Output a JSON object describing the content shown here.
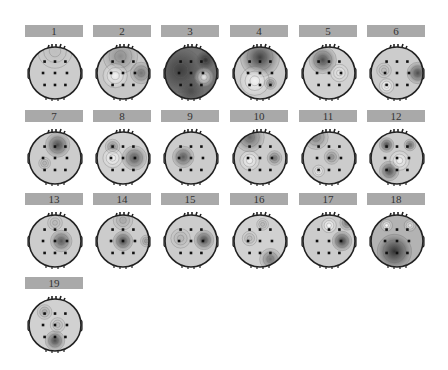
{
  "figure": {
    "type": "eeg-topographic-maps-grid",
    "colormap": "grayscale",
    "columns": 6,
    "electrodes_per_map": 9,
    "maps": [
      {
        "label": "1",
        "blobs": [
          {
            "x": 0.5,
            "y": 0.08,
            "r": 0.35,
            "v": 0.75
          }
        ],
        "base": 0.8
      },
      {
        "label": "2",
        "blobs": [
          {
            "x": 0.45,
            "y": 0.18,
            "r": 0.35,
            "v": 0.55
          },
          {
            "x": 0.85,
            "y": 0.5,
            "r": 0.22,
            "v": 0.45
          },
          {
            "x": 0.35,
            "y": 0.55,
            "r": 0.25,
            "v": 0.95
          }
        ],
        "base": 0.78
      },
      {
        "label": "3",
        "blobs": [
          {
            "x": 0.3,
            "y": 0.45,
            "r": 0.45,
            "v": 0.25
          },
          {
            "x": 0.78,
            "y": 0.25,
            "r": 0.18,
            "v": 0.2
          },
          {
            "x": 0.75,
            "y": 0.58,
            "r": 0.2,
            "v": 0.9
          },
          {
            "x": 0.5,
            "y": 0.85,
            "r": 0.25,
            "v": 0.3
          }
        ],
        "base": 0.45
      },
      {
        "label": "4",
        "blobs": [
          {
            "x": 0.5,
            "y": 0.2,
            "r": 0.4,
            "v": 0.25
          },
          {
            "x": 0.4,
            "y": 0.65,
            "r": 0.3,
            "v": 0.95
          },
          {
            "x": 0.7,
            "y": 0.7,
            "r": 0.12,
            "v": 0.55
          }
        ],
        "base": 0.8
      },
      {
        "label": "5",
        "blobs": [
          {
            "x": 0.38,
            "y": 0.25,
            "r": 0.28,
            "v": 0.3
          },
          {
            "x": 0.7,
            "y": 0.5,
            "r": 0.18,
            "v": 0.9
          }
        ],
        "base": 0.82
      },
      {
        "label": "6",
        "blobs": [
          {
            "x": 0.9,
            "y": 0.5,
            "r": 0.22,
            "v": 0.3
          },
          {
            "x": 0.3,
            "y": 0.75,
            "r": 0.15,
            "v": 0.98
          },
          {
            "x": 0.25,
            "y": 0.45,
            "r": 0.15,
            "v": 0.72
          }
        ],
        "base": 0.8
      },
      {
        "label": "7",
        "blobs": [
          {
            "x": 0.55,
            "y": 0.25,
            "r": 0.25,
            "v": 0.3
          },
          {
            "x": 0.3,
            "y": 0.6,
            "r": 0.12,
            "v": 0.7
          }
        ],
        "base": 0.8
      },
      {
        "label": "8",
        "blobs": [
          {
            "x": 0.72,
            "y": 0.5,
            "r": 0.25,
            "v": 0.35
          },
          {
            "x": 0.3,
            "y": 0.28,
            "r": 0.15,
            "v": 0.55
          },
          {
            "x": 0.3,
            "y": 0.5,
            "r": 0.2,
            "v": 0.95
          }
        ],
        "base": 0.82
      },
      {
        "label": "9",
        "blobs": [
          {
            "x": 0.35,
            "y": 0.48,
            "r": 0.22,
            "v": 0.35
          }
        ],
        "base": 0.8
      },
      {
        "label": "10",
        "blobs": [
          {
            "x": 0.3,
            "y": 0.1,
            "r": 0.3,
            "v": 0.4
          },
          {
            "x": 0.78,
            "y": 0.5,
            "r": 0.15,
            "v": 0.45
          },
          {
            "x": 0.3,
            "y": 0.55,
            "r": 0.2,
            "v": 0.95
          }
        ],
        "base": 0.8
      },
      {
        "label": "11",
        "blobs": [
          {
            "x": 0.25,
            "y": 0.1,
            "r": 0.25,
            "v": 0.5
          },
          {
            "x": 0.55,
            "y": 0.48,
            "r": 0.15,
            "v": 0.55
          },
          {
            "x": 0.3,
            "y": 0.75,
            "r": 0.12,
            "v": 0.98
          }
        ],
        "base": 0.8
      },
      {
        "label": "12",
        "blobs": [
          {
            "x": 0.3,
            "y": 0.25,
            "r": 0.15,
            "v": 0.3
          },
          {
            "x": 0.75,
            "y": 0.25,
            "r": 0.12,
            "v": 0.4
          },
          {
            "x": 0.35,
            "y": 0.75,
            "r": 0.2,
            "v": 0.3
          },
          {
            "x": 0.55,
            "y": 0.55,
            "r": 0.2,
            "v": 0.95
          }
        ],
        "base": 0.8
      },
      {
        "label": "13",
        "blobs": [
          {
            "x": 0.62,
            "y": 0.5,
            "r": 0.22,
            "v": 0.35
          },
          {
            "x": 0.5,
            "y": 0.15,
            "r": 0.15,
            "v": 0.72
          }
        ],
        "base": 0.8
      },
      {
        "label": "14",
        "blobs": [
          {
            "x": 0.5,
            "y": 0.5,
            "r": 0.2,
            "v": 0.3
          },
          {
            "x": 0.5,
            "y": 0.1,
            "r": 0.2,
            "v": 0.65
          },
          {
            "x": 0.95,
            "y": 0.5,
            "r": 0.12,
            "v": 0.6
          }
        ],
        "base": 0.8
      },
      {
        "label": "15",
        "blobs": [
          {
            "x": 0.75,
            "y": 0.48,
            "r": 0.2,
            "v": 0.3
          },
          {
            "x": 0.3,
            "y": 0.45,
            "r": 0.2,
            "v": 0.7
          }
        ],
        "base": 0.8
      },
      {
        "label": "16",
        "blobs": [
          {
            "x": 0.7,
            "y": 0.85,
            "r": 0.22,
            "v": 0.45
          },
          {
            "x": 0.55,
            "y": 0.18,
            "r": 0.12,
            "v": 0.72
          },
          {
            "x": 0.3,
            "y": 0.45,
            "r": 0.15,
            "v": 0.72
          }
        ],
        "base": 0.82
      },
      {
        "label": "17",
        "blobs": [
          {
            "x": 0.75,
            "y": 0.5,
            "r": 0.2,
            "v": 0.25
          },
          {
            "x": 0.85,
            "y": 0.15,
            "r": 0.15,
            "v": 0.45
          },
          {
            "x": 0.5,
            "y": 0.2,
            "r": 0.15,
            "v": 0.98
          }
        ],
        "base": 0.8
      },
      {
        "label": "18",
        "blobs": [
          {
            "x": 0.45,
            "y": 0.7,
            "r": 0.35,
            "v": 0.2
          },
          {
            "x": 0.3,
            "y": 0.2,
            "r": 0.12,
            "v": 0.98
          },
          {
            "x": 0.75,
            "y": 0.2,
            "r": 0.12,
            "v": 0.9
          }
        ],
        "base": 0.7
      },
      {
        "label": "19",
        "blobs": [
          {
            "x": 0.5,
            "y": 0.8,
            "r": 0.2,
            "v": 0.3
          },
          {
            "x": 0.3,
            "y": 0.25,
            "r": 0.15,
            "v": 0.65
          },
          {
            "x": 0.55,
            "y": 0.5,
            "r": 0.15,
            "v": 0.72
          }
        ],
        "base": 0.82
      }
    ]
  }
}
